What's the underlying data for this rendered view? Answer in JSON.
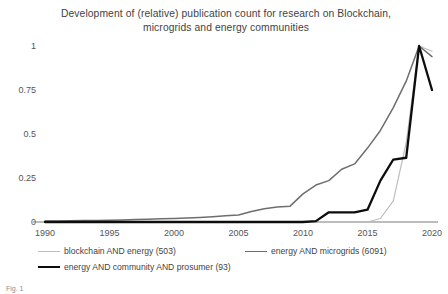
{
  "figure": {
    "title": "Development of (relative) publication count for research on Blockchain, microgrids and energy communities",
    "title_line1": "Development of (relative) publication count for research on Blockchain,",
    "title_line2": "microgrids and energy communities",
    "caption": "Fig. 1"
  },
  "legend": {
    "blockchain_label": "blockchain AND energy (503)",
    "microgrids_label": "energy AND microgrids (6091)",
    "prosumer_label": "energy AND community AND prosumer (93)"
  },
  "chart_data": {
    "type": "line",
    "title": "Development of (relative) publication count for research on Blockchain, microgrids and energy communities",
    "xlabel": "",
    "ylabel": "",
    "xlim": [
      1990,
      2020
    ],
    "ylim": [
      0,
      1
    ],
    "xticks": [
      1990,
      1995,
      2000,
      2005,
      2010,
      2015,
      2020
    ],
    "yticks": [
      0,
      0.25,
      0.5,
      0.75,
      1
    ],
    "ytick_labels": [
      "0",
      "0.25",
      "0.5",
      "0.75",
      "1"
    ],
    "xtick_labels": [
      "1990",
      "1995",
      "2000",
      "2005",
      "2010",
      "2015",
      "2020"
    ],
    "grid": false,
    "legend_position": "below",
    "colors": {
      "blockchain": "#bdbdbd",
      "microgrids": "#6e6e6e",
      "prosumer": "#0d0d0d"
    },
    "x": [
      1990,
      1991,
      1992,
      1993,
      1994,
      1995,
      1996,
      1997,
      1998,
      1999,
      2000,
      2001,
      2002,
      2003,
      2004,
      2005,
      2006,
      2007,
      2008,
      2009,
      2010,
      2011,
      2012,
      2013,
      2014,
      2015,
      2016,
      2017,
      2018,
      2019,
      2020
    ],
    "series": [
      {
        "name": "blockchain AND energy (503)",
        "count": 503,
        "color": "#bdbdbd",
        "values": [
          0,
          0,
          0,
          0,
          0,
          0,
          0,
          0,
          0,
          0,
          0,
          0,
          0,
          0,
          0,
          0,
          0,
          0,
          0,
          0,
          0,
          0,
          0,
          0,
          0,
          0,
          0.02,
          0.12,
          0.45,
          1.0,
          0.97
        ]
      },
      {
        "name": "energy AND microgrids (6091)",
        "count": 6091,
        "color": "#6e6e6e",
        "values": [
          0.005,
          0.006,
          0.007,
          0.008,
          0.009,
          0.01,
          0.012,
          0.014,
          0.016,
          0.018,
          0.02,
          0.023,
          0.026,
          0.03,
          0.035,
          0.04,
          0.06,
          0.075,
          0.085,
          0.09,
          0.16,
          0.21,
          0.235,
          0.3,
          0.33,
          0.42,
          0.52,
          0.65,
          0.8,
          1.0,
          0.94
        ]
      },
      {
        "name": "energy AND community AND prosumer (93)",
        "count": 93,
        "color": "#0d0d0d",
        "values": [
          0,
          0,
          0,
          0,
          0,
          0,
          0,
          0,
          0,
          0,
          0,
          0,
          0,
          0,
          0,
          0,
          0,
          0,
          0,
          0,
          0,
          0.005,
          0.055,
          0.055,
          0.055,
          0.07,
          0.235,
          0.355,
          0.365,
          1.0,
          0.75
        ]
      }
    ]
  }
}
